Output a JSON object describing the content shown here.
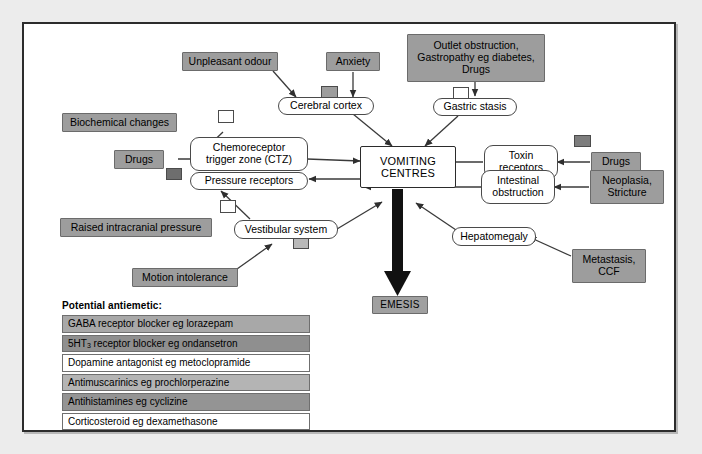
{
  "diagram": {
    "center_node": {
      "line1": "VOMITING",
      "line2": "CENTRES"
    },
    "outcome_node": {
      "label": "EMESIS"
    },
    "colors": {
      "page_background": "#ececec",
      "panel_background": "#ffffff",
      "frame_border": "#2c2c2c",
      "grey_box_fill": "#9d9d9d",
      "node_border": "#4a4a4a",
      "edge_stroke": "#3a3a3a",
      "chip_white": "#ffffff",
      "chip_light": "#b9b9b9",
      "chip_medium": "#9d9d9d",
      "chip_dark": "#6e6e6e"
    },
    "nodes": [
      {
        "id": "unpleasant-odour",
        "label": "Unpleasant odour",
        "style": "sharp-grey"
      },
      {
        "id": "anxiety",
        "label": "Anxiety",
        "style": "sharp-grey"
      },
      {
        "id": "cerebral-cortex",
        "label": "Cerebral cortex",
        "style": "rounded-white"
      },
      {
        "id": "outlet-obstruction",
        "label": "Outlet obstruction, Gastropathy eg diabetes, Drugs",
        "style": "sharp-grey"
      },
      {
        "id": "gastric-stasis",
        "label": "Gastric stasis",
        "style": "rounded-white"
      },
      {
        "id": "biochemical-changes",
        "label": "Biochemical changes",
        "style": "sharp-grey"
      },
      {
        "id": "drugs-left",
        "label": "Drugs",
        "style": "sharp-grey"
      },
      {
        "id": "ctz",
        "label": "Chemoreceptor trigger zone (CTZ)",
        "style": "rounded-white"
      },
      {
        "id": "pressure-receptors",
        "label": "Pressure receptors",
        "style": "rounded-white"
      },
      {
        "id": "raised-icp",
        "label": "Raised intracranial pressure",
        "style": "sharp-grey"
      },
      {
        "id": "toxin-receptors",
        "label": "Toxin receptors",
        "style": "rounded-white"
      },
      {
        "id": "drugs-right",
        "label": "Drugs",
        "style": "sharp-grey"
      },
      {
        "id": "intestinal-obstruction",
        "label": "Intestinal obstruction",
        "style": "rounded-white"
      },
      {
        "id": "neoplasia-stricture",
        "label": "Neoplasia, Stricture",
        "style": "sharp-grey"
      },
      {
        "id": "vestibular-system",
        "label": "Vestibular system",
        "style": "rounded-white"
      },
      {
        "id": "motion-intolerance",
        "label": "Motion intolerance",
        "style": "sharp-grey"
      },
      {
        "id": "hepatomegaly",
        "label": "Hepatomegaly",
        "style": "rounded-white"
      },
      {
        "id": "metastasis-ccf",
        "label": "Metastasis, CCF",
        "style": "sharp-grey"
      },
      {
        "id": "vomiting-centres",
        "label": "VOMITING CENTRES",
        "style": "center-white"
      },
      {
        "id": "emesis",
        "label": "EMESIS",
        "style": "sharp-grey"
      }
    ],
    "labels": {
      "outlet_line1": "Outlet obstruction,",
      "outlet_line2": "Gastropathy eg diabetes,",
      "outlet_line3": "Drugs",
      "ctz_line1": "Chemoreceptor",
      "ctz_line2": "trigger zone (CTZ)",
      "toxin_line1": "Toxin",
      "toxin_line2": "receptors",
      "intestinal_line1": "Intestinal",
      "intestinal_line2": "obstruction",
      "neoplasia_line1": "Neoplasia,",
      "neoplasia_line2": "Stricture",
      "metastasis_line1": "Metastasis,",
      "metastasis_line2": "CCF",
      "unpleasant_odour": "Unpleasant odour",
      "anxiety": "Anxiety",
      "cerebral_cortex": "Cerebral cortex",
      "gastric_stasis": "Gastric stasis",
      "biochemical_changes": "Biochemical changes",
      "drugs_left": "Drugs",
      "drugs_right": "Drugs",
      "pressure_receptors": "Pressure receptors",
      "raised_icp": "Raised intracranial pressure",
      "vestibular_system": "Vestibular system",
      "motion_intolerance": "Motion intolerance",
      "hepatomegaly": "Hepatomegaly",
      "emesis": "EMESIS"
    },
    "markers": [
      {
        "id": "chip-cerebral-cortex",
        "linked_to": "cerebral-cortex",
        "shade": "#9d9d9d"
      },
      {
        "id": "chip-gastric-stasis",
        "linked_to": "gastric-stasis",
        "shade": "#ffffff"
      },
      {
        "id": "chip-biochemical",
        "linked_to": "ctz",
        "shade": "#ffffff"
      },
      {
        "id": "chip-drugs-ctz",
        "linked_to": "ctz",
        "shade": "#6e6e6e"
      },
      {
        "id": "chip-pressure-receptors",
        "linked_to": "pressure-receptors",
        "shade": "#ffffff"
      },
      {
        "id": "chip-toxin-receptors",
        "linked_to": "toxin-receptors",
        "shade": "#7d7d7d"
      },
      {
        "id": "chip-vestibular",
        "linked_to": "vestibular-system",
        "shade": "#b9b9b9"
      }
    ]
  },
  "legend": {
    "title": "Potential antiemetic:",
    "rows": [
      {
        "text": "GABA receptor blocker eg lorazepam",
        "fill": "#a8a8a8",
        "sub": ""
      },
      {
        "text": "receptor blocker eg ondansetron",
        "fill": "#8f8f8f",
        "prefix": "5HT",
        "sub": "3"
      },
      {
        "text": "Dopamine antagonist eg metoclopramide",
        "fill": "#ffffff",
        "sub": ""
      },
      {
        "text": "Antimuscarinics eg prochlorperazine",
        "fill": "#b4b4b4",
        "sub": ""
      },
      {
        "text": "Antihistamines eg cyclizine",
        "fill": "#949494",
        "sub": ""
      },
      {
        "text": "Corticosteroid eg dexamethasone",
        "fill": "#ffffff",
        "sub": ""
      }
    ]
  }
}
